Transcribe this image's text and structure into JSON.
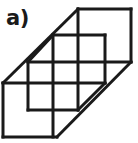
{
  "figure": {
    "panel_label": "a)",
    "caption": "",
    "stroke_color": "#1a1a1a",
    "background_color": "#ffffff",
    "stroke_width": 3,
    "width": 138,
    "height": 143,
    "geometry": {
      "outline": [
        [
          3,
          83
        ],
        [
          78,
          9
        ],
        [
          131,
          9
        ],
        [
          131,
          62
        ],
        [
          57,
          137
        ],
        [
          3,
          137
        ]
      ],
      "segments": [
        {
          "name": "outline-diagonal-upper-left",
          "x1": 3,
          "y1": 83,
          "x2": 78,
          "y2": 9
        },
        {
          "name": "outline-top-edge",
          "x1": 78,
          "y1": 9,
          "x2": 131,
          "y2": 9
        },
        {
          "name": "outline-right-edge",
          "x1": 131,
          "y1": 9,
          "x2": 131,
          "y2": 62
        },
        {
          "name": "outline-diagonal-lower-right",
          "x1": 131,
          "y1": 62,
          "x2": 57,
          "y2": 137
        },
        {
          "name": "outline-bottom-edge",
          "x1": 57,
          "y1": 137,
          "x2": 3,
          "y2": 137
        },
        {
          "name": "outline-left-edge",
          "x1": 3,
          "y1": 137,
          "x2": 3,
          "y2": 83
        },
        {
          "name": "inner-horizontal-upper",
          "x1": 53,
          "y1": 35,
          "x2": 105,
          "y2": 35
        },
        {
          "name": "inner-horizontal-middle",
          "x1": 28,
          "y1": 62,
          "x2": 131,
          "y2": 62
        },
        {
          "name": "inner-horizontal-lower",
          "x1": 3,
          "y1": 83,
          "x2": 105,
          "y2": 83
        },
        {
          "name": "inner-horizontal-bottom",
          "x1": 28,
          "y1": 110,
          "x2": 78,
          "y2": 110
        },
        {
          "name": "inner-vertical-left",
          "x1": 28,
          "y1": 62,
          "x2": 28,
          "y2": 110
        },
        {
          "name": "inner-vertical-midleft",
          "x1": 53,
          "y1": 35,
          "x2": 53,
          "y2": 137
        },
        {
          "name": "inner-vertical-center",
          "x1": 78,
          "y1": 9,
          "x2": 78,
          "y2": 110
        },
        {
          "name": "inner-vertical-right",
          "x1": 105,
          "y1": 35,
          "x2": 105,
          "y2": 83
        },
        {
          "name": "inner-diagonal-upper",
          "x1": 28,
          "y1": 62,
          "x2": 53,
          "y2": 35
        },
        {
          "name": "inner-diagonal-lower",
          "x1": 78,
          "y1": 110,
          "x2": 105,
          "y2": 83
        }
      ]
    }
  }
}
